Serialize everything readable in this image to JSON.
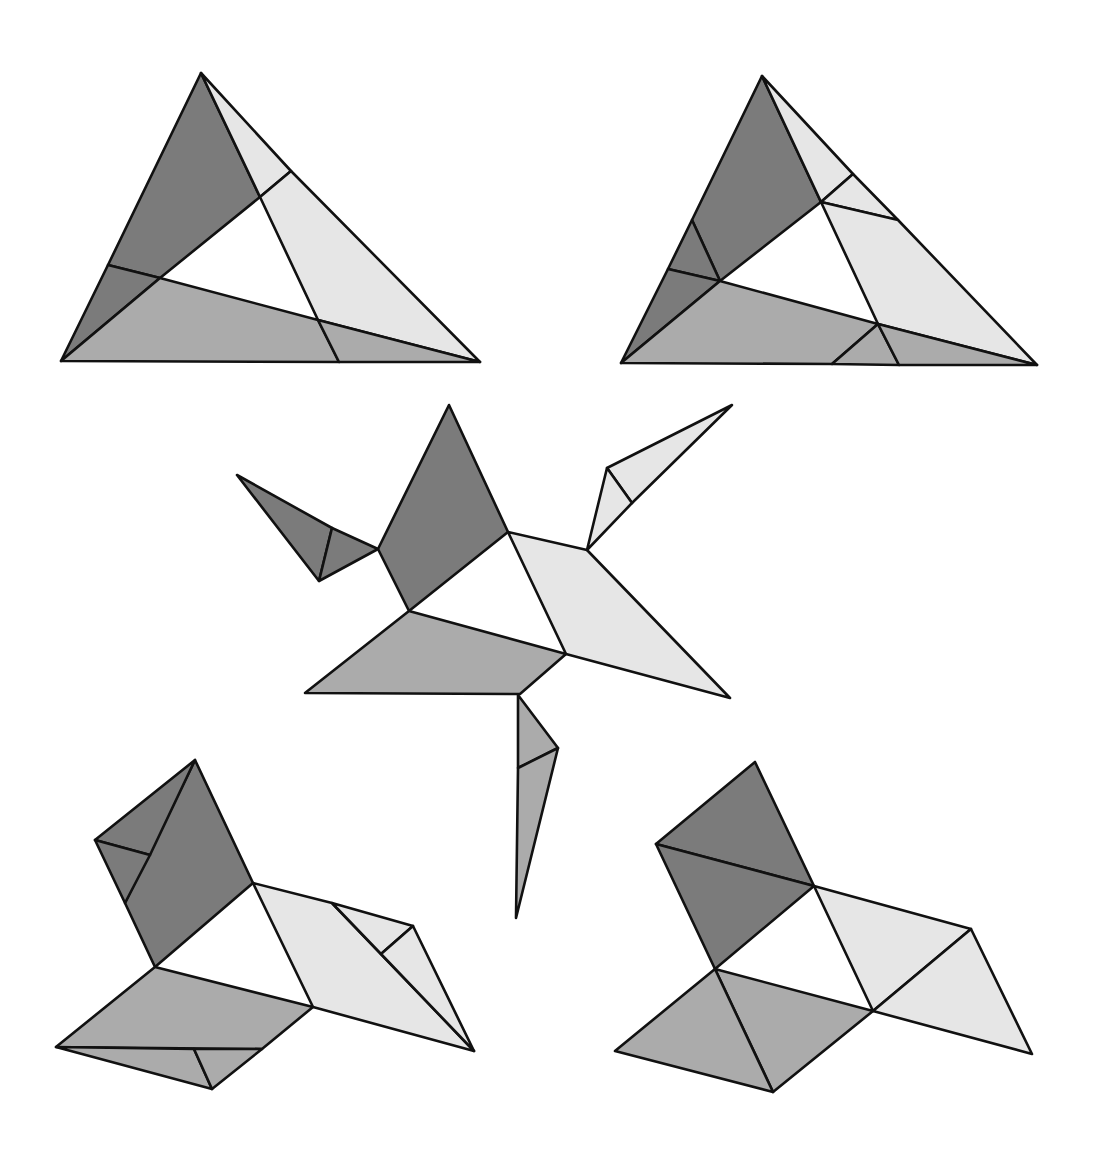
{
  "diagram": {
    "colors": {
      "dark": "#7b7b7b",
      "medium": "#ababab",
      "light": "#e6e6e6",
      "stroke": "#111111",
      "background": "#ffffff"
    },
    "figures": [
      {
        "id": "figure-1-triangle",
        "pieces": [
          {
            "shade": "dark",
            "points": "201,73 260,197 160,278 108,265"
          },
          {
            "shade": "dark",
            "points": "108,265 160,278 61,361"
          },
          {
            "shade": "light",
            "points": "201,73 291,171 260,197"
          },
          {
            "shade": "light",
            "points": "291,171 480,362 318,320 260,197"
          },
          {
            "shade": "medium",
            "points": "160,278 318,320 339,362 61,361"
          },
          {
            "shade": "medium",
            "points": "318,320 480,362 339,362"
          }
        ],
        "lines": []
      },
      {
        "id": "figure-2-triangle",
        "pieces": [
          {
            "shade": "dark",
            "points": "762,76 821,202 720,281 692,220"
          },
          {
            "shade": "dark",
            "points": "692,220 720,281 668,269"
          },
          {
            "shade": "dark",
            "points": "668,269 720,281 621,363"
          },
          {
            "shade": "light",
            "points": "762,76 853,174 821,202"
          },
          {
            "shade": "light",
            "points": "853,174 898,220 821,202"
          },
          {
            "shade": "light",
            "points": "821,202 898,220 1037,365 878,324"
          },
          {
            "shade": "medium",
            "points": "720,281 878,324 832,364 621,363"
          },
          {
            "shade": "medium",
            "points": "878,324 899,365 832,364"
          },
          {
            "shade": "medium",
            "points": "878,324 1037,365 899,365"
          }
        ],
        "lines": []
      },
      {
        "id": "figure-3-exploded",
        "pieces": [
          {
            "shade": "dark",
            "points": "449,405 508,532 409,611 378,549"
          },
          {
            "shade": "dark",
            "points": "237,475 332,528 319,581"
          },
          {
            "shade": "dark",
            "points": "332,528 378,549 319,581"
          },
          {
            "shade": "light",
            "points": "508,532 587,550 730,698 566,654"
          },
          {
            "shade": "light",
            "points": "732,405 632,503 607,468"
          },
          {
            "shade": "light",
            "points": "607,468 632,503 587,550"
          },
          {
            "shade": "medium",
            "points": "409,611 566,654 520,694 305,693"
          },
          {
            "shade": "medium",
            "points": "518,695 558,748 518,768"
          },
          {
            "shade": "medium",
            "points": "518,768 558,748 516,918"
          }
        ],
        "lines": []
      },
      {
        "id": "figure-4-hinged",
        "pieces": [
          {
            "shade": "dark",
            "points": "195,760 253,883 155,967 125,903"
          },
          {
            "shade": "dark",
            "points": "195,760 150,855 95,840"
          },
          {
            "shade": "dark",
            "points": "95,840 150,855 125,903"
          },
          {
            "shade": "light",
            "points": "253,883 332,903 474,1051 313,1007"
          },
          {
            "shade": "light",
            "points": "332,903 413,926 381,954"
          },
          {
            "shade": "light",
            "points": "381,954 413,926 474,1051"
          },
          {
            "shade": "medium",
            "points": "155,967 313,1007 262,1049 56,1047"
          },
          {
            "shade": "medium",
            "points": "56,1047 194,1049 212,1089"
          },
          {
            "shade": "medium",
            "points": "194,1049 262,1049 212,1089"
          }
        ],
        "lines": []
      },
      {
        "id": "figure-5-square-arrangement",
        "pieces": [
          {
            "shade": "dark",
            "points": "755,762 814,886 656,844"
          },
          {
            "shade": "dark",
            "points": "656,844 814,886 715,969"
          },
          {
            "shade": "light",
            "points": "814,886 971,929 873,1011"
          },
          {
            "shade": "light",
            "points": "971,929 1032,1054 873,1011"
          },
          {
            "shade": "medium",
            "points": "715,969 873,1011 773,1092"
          },
          {
            "shade": "medium",
            "points": "715,969 773,1092 615,1051"
          }
        ],
        "lines": []
      }
    ]
  }
}
